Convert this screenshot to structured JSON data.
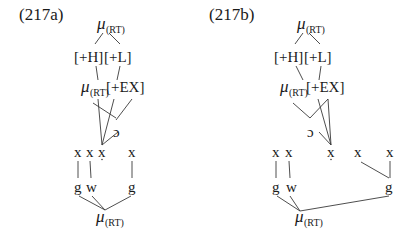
{
  "figure": {
    "panels": [
      {
        "id": "217a",
        "label": "(217a)",
        "top_mu": {
          "symbol": "μ",
          "subscript": "(RT)"
        },
        "features_row1": {
          "h": "[+H]",
          "l": "[+L]"
        },
        "row2": {
          "mu": {
            "symbol": "μ",
            "subscript": "(RT)"
          },
          "ex": "[+EX]"
        },
        "hook": "ɔ",
        "x_slots": [
          "x",
          "x",
          "x",
          "x"
        ],
        "x_dotted_index": 2,
        "segments": [
          "g",
          "w",
          "g"
        ],
        "bottom_mu": {
          "symbol": "μ",
          "subscript": "(RT)"
        }
      },
      {
        "id": "217b",
        "label": "(217b)",
        "top_mu": {
          "symbol": "μ",
          "subscript": "(RT)"
        },
        "features_row1": {
          "h": "[+H]",
          "l": "[+L]"
        },
        "row2": {
          "mu": {
            "symbol": "μ",
            "subscript": "(RT)"
          },
          "ex": "[+EX]"
        },
        "hook": "ɔ",
        "x_slots": [
          "x",
          "x",
          "x",
          "x",
          "x"
        ],
        "x_dotted_index": 2,
        "segments": [
          "g",
          "w",
          "g"
        ],
        "bottom_mu": {
          "symbol": "μ",
          "subscript": "(RT)"
        }
      }
    ]
  }
}
